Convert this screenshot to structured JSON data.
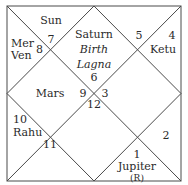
{
  "chart": {
    "style": "North Indian Rasi chart",
    "line_color": "#4a4a4a",
    "text_color": "#2a2a2a",
    "houses": [
      {
        "house": 1,
        "region": "top-diamond",
        "sign": "6",
        "planets": [
          "Saturn"
        ],
        "notes": [
          "Birth",
          "Lagna"
        ]
      },
      {
        "house": 2,
        "region": "top-left-triangle",
        "sign": "7",
        "planets": [
          "Sun"
        ]
      },
      {
        "house": 3,
        "region": "left-upper-triangle",
        "sign": "8",
        "planets": [
          "Mer",
          "Ven"
        ]
      },
      {
        "house": 4,
        "region": "left-diamond",
        "sign": "9",
        "planets": [
          "Mars"
        ]
      },
      {
        "house": 5,
        "region": "left-lower-triangle",
        "sign": "10",
        "planets": [
          "Rahu"
        ]
      },
      {
        "house": 6,
        "region": "bottom-left-triangle",
        "sign": "11",
        "planets": []
      },
      {
        "house": 7,
        "region": "bottom-diamond",
        "sign": "12",
        "planets": []
      },
      {
        "house": 8,
        "region": "bottom-right-triangle",
        "sign": "1",
        "planets": [
          "Jupiter"
        ],
        "suffix": "(R)"
      },
      {
        "house": 9,
        "region": "right-lower-triangle",
        "sign": "2",
        "planets": []
      },
      {
        "house": 10,
        "region": "right-diamond",
        "sign": "3",
        "planets": []
      },
      {
        "house": 11,
        "region": "right-upper-triangle",
        "sign": "4",
        "planets": [
          "Ketu"
        ]
      },
      {
        "house": 12,
        "region": "top-right-triangle",
        "sign": "5",
        "planets": []
      }
    ]
  }
}
